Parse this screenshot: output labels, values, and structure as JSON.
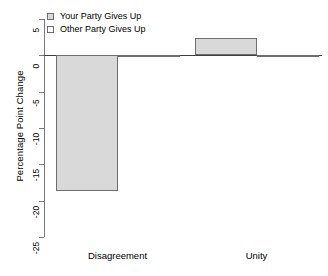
{
  "chart_data": {
    "type": "bar",
    "title": "",
    "xlabel": "",
    "ylabel": "Percentage Point Change",
    "categories": [
      "Disagreement",
      "Unity"
    ],
    "series": [
      {
        "name": "Your Party Gives Up",
        "swatch": "shaded",
        "values": [
          -18.7,
          2.4
        ]
      },
      {
        "name": "Other Party Gives Up",
        "swatch": "open",
        "values": [
          -0.2,
          -0.2
        ]
      }
    ],
    "ylim": [
      -25,
      5
    ],
    "yticks": [
      5,
      0,
      -5,
      -10,
      -15,
      -20,
      -25
    ],
    "ytick_labels": [
      "5",
      "0",
      "-5",
      "-10",
      "-15",
      "-20",
      "-25"
    ],
    "grid": false,
    "legend_position": "top-left",
    "colors": {
      "shaded_fill": "#d9d9d9",
      "open_fill": "#ffffff",
      "bar_border": "#6e6e6e",
      "axis": "#7a7a7a",
      "zero_line": "#3f3f3f",
      "background": "#ffffff",
      "text": "#000000"
    }
  },
  "axis": {
    "y_title": "Percentage Point Change"
  },
  "legend": {
    "items": [
      {
        "label": "Your Party Gives Up"
      },
      {
        "label": "Other Party Gives Up"
      }
    ]
  },
  "xaxis": {
    "labels": [
      "Disagreement",
      "Unity"
    ]
  }
}
